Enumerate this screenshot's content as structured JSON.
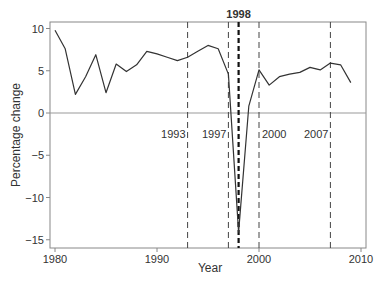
{
  "chart_data": {
    "type": "line",
    "title": "",
    "xlabel": "Year",
    "ylabel": "Percentage change",
    "xlim": [
      1979.8,
      2010.5
    ],
    "ylim": [
      -15.8,
      10.8
    ],
    "xticks": [
      1980,
      1990,
      2000,
      2010
    ],
    "yticks": [
      10,
      5,
      0,
      -5,
      -10,
      -15
    ],
    "ytick_labels": [
      "10",
      "5",
      "0",
      "−5",
      "−10",
      "−15"
    ],
    "grid": false,
    "legend": null,
    "reference_line": {
      "y": 0,
      "color": "#999999"
    },
    "series": [
      {
        "name": "Percentage change",
        "color": "#333333",
        "x": [
          1980,
          1981,
          1982,
          1983,
          1984,
          1985,
          1986,
          1987,
          1988,
          1989,
          1990,
          1991,
          1992,
          1993,
          1994,
          1995,
          1996,
          1997,
          1998,
          1999,
          2000,
          2001,
          2002,
          2003,
          2004,
          2005,
          2006,
          2007,
          2008,
          2009
        ],
        "values": [
          9.8,
          7.6,
          2.2,
          4.3,
          6.9,
          2.4,
          5.8,
          4.9,
          5.7,
          7.3,
          7.0,
          6.6,
          6.2,
          6.6,
          7.3,
          8.0,
          7.6,
          4.6,
          -14.1,
          0.8,
          5.1,
          3.3,
          4.3,
          4.6,
          4.8,
          5.4,
          5.1,
          5.9,
          5.7,
          3.6
        ]
      }
    ],
    "annotations": [
      {
        "x": 1993,
        "label": "1993",
        "style": "dashed",
        "bold": false,
        "label_y": -2.5,
        "label_side": "left"
      },
      {
        "x": 1997,
        "label": "1997",
        "style": "dashed",
        "bold": false,
        "label_y": -2.5,
        "label_side": "left"
      },
      {
        "x": 1998,
        "label": "1998",
        "style": "dashed-bold",
        "bold": true,
        "label_y": 11.3,
        "label_side": "top"
      },
      {
        "x": 2000,
        "label": "2000",
        "style": "dashed",
        "bold": false,
        "label_y": -2.5,
        "label_side": "right"
      },
      {
        "x": 2007,
        "label": "2007",
        "style": "dashed",
        "bold": false,
        "label_y": -2.5,
        "label_side": "left"
      }
    ]
  }
}
